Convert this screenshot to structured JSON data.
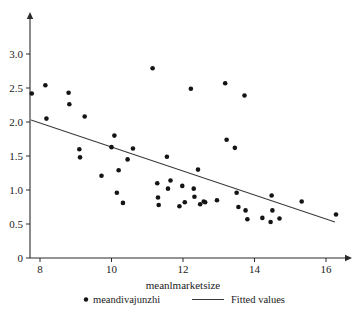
{
  "chart_data": {
    "type": "scatter",
    "title": "",
    "xlabel": "meanlmarketsize",
    "ylabel": "",
    "xlim": [
      7.5,
      16.8
    ],
    "ylim": [
      0,
      3.15
    ],
    "grid": false,
    "xticks": [
      8,
      10,
      12,
      14,
      16
    ],
    "xtick_labels": [
      "8",
      "10",
      "12",
      "14",
      "16"
    ],
    "yticks": [
      0,
      0.5,
      1.0,
      1.5,
      2.0,
      2.5,
      3.0
    ],
    "ytick_labels": [
      "0",
      "0.5",
      "1.0",
      "1.5",
      "2.0",
      "2.5",
      "3.0"
    ],
    "legend_position": "bottom",
    "series": [
      {
        "name": "meandivajunzhi",
        "type": "scatter",
        "marker": "circle",
        "color": "#141414",
        "points": [
          [
            7.77,
            2.42
          ],
          [
            8.15,
            2.54
          ],
          [
            8.18,
            2.05
          ],
          [
            8.8,
            2.43
          ],
          [
            8.82,
            2.26
          ],
          [
            9.1,
            1.6
          ],
          [
            9.12,
            1.48
          ],
          [
            9.25,
            2.08
          ],
          [
            9.72,
            1.21
          ],
          [
            10.0,
            1.63
          ],
          [
            10.08,
            1.8
          ],
          [
            10.15,
            0.96
          ],
          [
            10.2,
            1.29
          ],
          [
            10.32,
            0.81
          ],
          [
            10.45,
            1.45
          ],
          [
            10.6,
            1.61
          ],
          [
            11.15,
            2.79
          ],
          [
            11.28,
            1.1
          ],
          [
            11.3,
            0.89
          ],
          [
            11.32,
            0.78
          ],
          [
            11.55,
            1.49
          ],
          [
            11.58,
            1.02
          ],
          [
            11.65,
            1.14
          ],
          [
            11.9,
            0.76
          ],
          [
            11.98,
            1.06
          ],
          [
            12.05,
            0.82
          ],
          [
            12.22,
            2.49
          ],
          [
            12.3,
            1.02
          ],
          [
            12.32,
            0.9
          ],
          [
            12.42,
            1.3
          ],
          [
            12.48,
            0.79
          ],
          [
            12.58,
            0.83
          ],
          [
            12.62,
            0.82
          ],
          [
            12.95,
            0.85
          ],
          [
            13.18,
            2.57
          ],
          [
            13.22,
            1.74
          ],
          [
            13.45,
            1.62
          ],
          [
            13.5,
            0.96
          ],
          [
            13.55,
            0.75
          ],
          [
            13.72,
            2.39
          ],
          [
            13.75,
            0.7
          ],
          [
            13.8,
            0.57
          ],
          [
            14.22,
            0.59
          ],
          [
            14.45,
            0.53
          ],
          [
            14.48,
            0.92
          ],
          [
            14.5,
            0.7
          ],
          [
            14.7,
            0.58
          ],
          [
            15.32,
            0.83
          ],
          [
            16.28,
            0.64
          ]
        ]
      },
      {
        "name": "Fitted values",
        "type": "line",
        "color": "#3a3a3a",
        "endpoints": [
          [
            7.75,
            2.03
          ],
          [
            16.25,
            0.53
          ]
        ],
        "slope": -0.1765,
        "intercept": 3.398
      }
    ]
  },
  "axes": {
    "x_title": "meanlmarketsize"
  },
  "legend": {
    "items": [
      {
        "label": "meandivajunzhi",
        "marker": "dot"
      },
      {
        "label": "Fitted values",
        "marker": "line"
      }
    ]
  }
}
